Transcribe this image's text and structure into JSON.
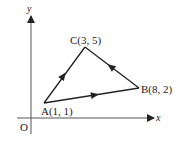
{
  "diagram": {
    "type": "coordinate-triangle",
    "axes": {
      "x_label": "x",
      "y_label": "y",
      "origin_label": "O"
    },
    "points": [
      {
        "name": "A",
        "label": "A(1, 1)",
        "coords": [
          1,
          1
        ]
      },
      {
        "name": "B",
        "label": "B(8, 2)",
        "coords": [
          8,
          2
        ]
      },
      {
        "name": "C",
        "label": "C(3, 5)",
        "coords": [
          3,
          5
        ]
      }
    ],
    "edges": [
      {
        "from": "A",
        "to": "B",
        "arrow_toward": "B"
      },
      {
        "from": "A",
        "to": "C",
        "arrow_toward": "C"
      },
      {
        "from": "B",
        "to": "C",
        "arrow_toward": "C"
      }
    ],
    "colors": {
      "stroke": "#222222",
      "background": "#ffffff"
    }
  }
}
